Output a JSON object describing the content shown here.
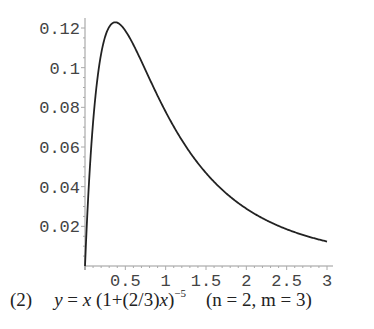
{
  "chart_data": {
    "type": "line",
    "title": "",
    "xlabel": "",
    "ylabel": "",
    "xlim": [
      0,
      3
    ],
    "ylim": [
      0,
      0.12
    ],
    "grid": false,
    "legend": null,
    "x_ticks": [
      "0.5",
      "1",
      "1.5",
      "2",
      "2.5",
      "3"
    ],
    "y_ticks": [
      "0.02",
      "0.04",
      "0.06",
      "0.08",
      "0.1",
      "0.12"
    ],
    "series": [
      {
        "name": "y = x(1+(2/3)x)^-5",
        "x": [
          0,
          0.025,
          0.05,
          0.1,
          0.15,
          0.2,
          0.25,
          0.3,
          0.375,
          0.45,
          0.5,
          0.6,
          0.75,
          1.0,
          1.25,
          1.5,
          1.75,
          2.0,
          2.25,
          2.5,
          2.75,
          3.0
        ],
        "values": [
          0,
          0.023,
          0.0424,
          0.0724,
          0.0937,
          0.107,
          0.1156,
          0.1204,
          0.1229,
          0.1212,
          0.1187,
          0.1105,
          0.0969,
          0.0778,
          0.061,
          0.0469,
          0.0366,
          0.0289,
          0.023,
          0.0185,
          0.015,
          0.0123
        ]
      }
    ],
    "annotations": []
  },
  "caption": {
    "number": "(2)",
    "eq_lhs": "y",
    "eq_eq": " = ",
    "eq_x": "x",
    "eq_paren": " (1+(2/3)",
    "eq_x2": "x",
    "eq_close": ")",
    "eq_exp": "−5",
    "params": "(n = 2, m = 3)"
  }
}
